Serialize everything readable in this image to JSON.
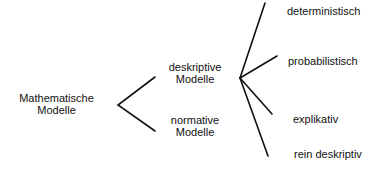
{
  "diagram": {
    "type": "tree",
    "orientation": "left-to-right",
    "line_color": "#111111",
    "text_color": "#111111",
    "background_color": "#ffffff",
    "nodes": {
      "root": {
        "line1": "Mathematische",
        "line2": "Modelle"
      },
      "deskriptive": {
        "line1": "deskriptive",
        "line2": "Modelle"
      },
      "normative": {
        "line1": "normative",
        "line2": "Modelle"
      },
      "deterministisch": {
        "label": "deterministisch"
      },
      "probabilistisch": {
        "label": "probabilistisch"
      },
      "explikativ": {
        "label": "explikativ"
      },
      "rein_deskriptiv": {
        "label": "rein deskriptiv"
      }
    },
    "edges": [
      {
        "from": "root",
        "to": "deskriptive"
      },
      {
        "from": "root",
        "to": "normative"
      },
      {
        "from": "deskriptive",
        "to": "deterministisch"
      },
      {
        "from": "deskriptive",
        "to": "probabilistisch"
      },
      {
        "from": "deskriptive",
        "to": "explikativ"
      },
      {
        "from": "deskriptive",
        "to": "rein_deskriptiv"
      }
    ]
  }
}
